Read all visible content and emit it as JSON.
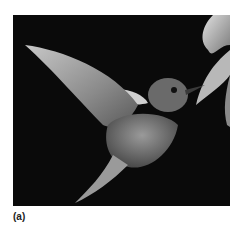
{
  "figure": {
    "panel_label": "(a)",
    "image_subject": "hummingbird hovering at flower",
    "background_color": "#0a0a0a"
  }
}
